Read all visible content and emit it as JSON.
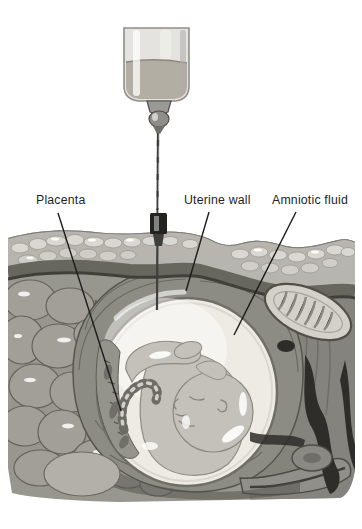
{
  "labels": {
    "placenta": "Placenta",
    "uterine_wall": "Uterine wall",
    "amniotic_fluid": "Amniotic fluid"
  },
  "colors": {
    "background": "#ffffff",
    "label_text": "#1e1e1e",
    "leader_line": "#1c1c1c",
    "syringe_glass": "#e4e3df",
    "syringe_fluid": "#b3aea3",
    "needle": "#3f3f3d",
    "skin_fat": "#b7b5af",
    "fat_lobule": "#d9d8d2",
    "muscle": "#67665f",
    "intestine": "#a29f99",
    "uterine_wall": "#8d8c85",
    "amniotic_sac": "#edebe4",
    "fetus_skin": "#c3c1ba",
    "placenta_tissue": "#94938c",
    "bone": "#d3d1c9",
    "dark_tissue": "#2e2d29",
    "base_tissue": "#98978f"
  }
}
